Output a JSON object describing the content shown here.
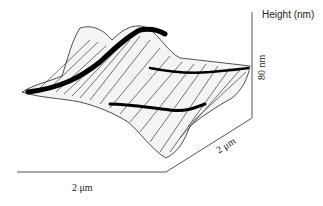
{
  "figure": {
    "type": "afm-3d-surface",
    "z_axis_title": "Height (nm)",
    "z_scale_label": "80 nm",
    "x_scale_label": "2 μm",
    "y_scale_label": "2 μm",
    "colors": {
      "ink": "#111111",
      "axis": "#555555",
      "background": "#ffffff"
    }
  }
}
